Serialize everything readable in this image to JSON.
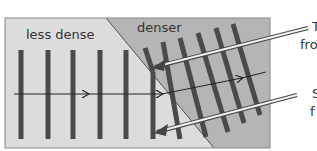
{
  "diagram": {
    "type": "wave-refraction",
    "regions": [
      {
        "label": "less dense",
        "fill": "#dcdcdc"
      },
      {
        "label": "denser",
        "fill": "#b5b5b5"
      }
    ],
    "colors": {
      "wavefront": "#4a4a4a",
      "ray": "#222222",
      "border": "#888888",
      "pointer_outline": "#444444",
      "pointer_fill": "#f2f2f2"
    },
    "side_labels": [
      {
        "text": "T",
        "line2": "fro"
      },
      {
        "text": "S",
        "line2": "f"
      }
    ]
  }
}
